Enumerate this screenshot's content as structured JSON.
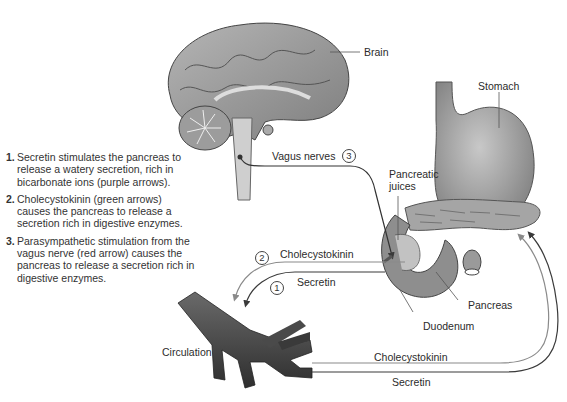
{
  "legend": {
    "items": [
      {
        "number": "1.",
        "text": "Secretin stimulates the pancreas to release a watery secretion, rich in bicarbonate ions (purple arrows)."
      },
      {
        "number": "2.",
        "text": "Cholecystokinin (green arrows) causes the pancreas to release a secretion rich in digestive enzymes."
      },
      {
        "number": "3.",
        "text": "Parasympathetic stimulation from the vagus nerve (red arrow) causes the pancreas to release a secretion rich in digestive enzymes."
      }
    ]
  },
  "labels": {
    "brain": "Brain",
    "stomach": "Stomach",
    "vagus_nerves": "Vagus nerves",
    "pancreatic_juices_line1": "Pancreatic",
    "pancreatic_juices_line2": "juices",
    "cholecystokinin_upper": "Cholecystokinin",
    "secretin_upper": "Secretin",
    "pancreas": "Pancreas",
    "duodenum": "Duodenum",
    "circulation": "Circulation",
    "cholecystokinin_lower": "Cholecystokinin",
    "secretin_lower": "Secretin"
  },
  "markers": {
    "one": "1",
    "two": "2",
    "three": "3"
  },
  "colors": {
    "line_dark": "#3a3a3a",
    "line_light": "#8a8a8a",
    "tissue": "#9a9a9a"
  }
}
